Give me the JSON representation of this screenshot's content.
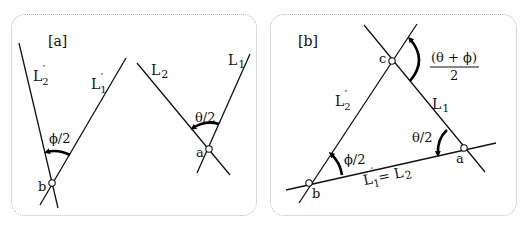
{
  "panels": [
    {
      "id": "a",
      "tag": "[a]",
      "labels": {
        "L2_prime": "L",
        "L2_prime_sub": "2",
        "L1_prime": "L",
        "L1_prime_sub": "1",
        "L2": "L",
        "L2_sub": "2",
        "L1": "L",
        "L1_sub": "1",
        "prime": "′",
        "angle_phi": "ϕ/2",
        "angle_theta": "θ/2",
        "point_a": "a",
        "point_b": "b"
      }
    },
    {
      "id": "b",
      "tag": "[b]",
      "labels": {
        "L2_prime": "L",
        "L2_prime_sub": "2",
        "L1": "L",
        "L1_sub": "1",
        "bottom_line_lhs": "L",
        "bottom_line_lhs_sub": "1",
        "bottom_line_eq": "= L",
        "bottom_line_rhs_sub": "2",
        "prime": "′",
        "angle_phi": "ϕ/2",
        "angle_theta": "θ/2",
        "angle_sum_numerator": "(θ + ϕ)",
        "angle_sum_denominator": "2",
        "point_a": "a",
        "point_b": "b",
        "point_c": "c"
      }
    }
  ],
  "colors": {
    "line": "#111111",
    "panel_border": "#b8b8b8",
    "background": "#ffffff"
  }
}
